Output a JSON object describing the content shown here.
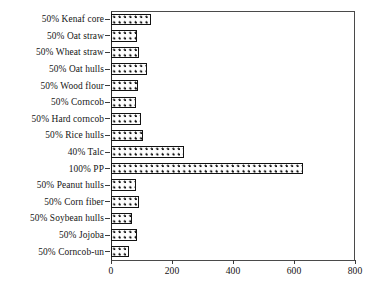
{
  "chart_data": {
    "type": "bar",
    "orientation": "horizontal",
    "title": "",
    "xlabel": "",
    "ylabel": "",
    "xlim": [
      0,
      800
    ],
    "xticks": [
      0,
      200,
      400,
      600,
      800
    ],
    "grid": false,
    "legend": false,
    "categories": [
      "50% Kenaf core",
      "50% Oat straw",
      "50% Wheat straw",
      "50% Oat hulls",
      "50% Wood flour",
      "50% Corncob",
      "50% Hard corncob",
      "50% Rice hulls",
      "40% Talc",
      "100% PP",
      "50% Peanut hulls",
      "50% Corn fiber",
      "50% Soybean hulls",
      "50% Jojoba",
      "50% Corncob-un"
    ],
    "values": [
      132,
      86,
      92,
      119,
      89,
      82,
      99,
      105,
      240,
      629,
      82,
      92,
      69,
      86,
      59
    ],
    "bar_fill": "dotted-pattern",
    "bar_edge_color": "#121212",
    "axis_color": "#3c3c3c",
    "background": "#ffffff"
  },
  "axis": {
    "ticks": [
      {
        "value": 0,
        "label": "0"
      },
      {
        "value": 200,
        "label": "200"
      },
      {
        "value": 400,
        "label": "400"
      },
      {
        "value": 600,
        "label": "600"
      },
      {
        "value": 800,
        "label": "800"
      }
    ]
  }
}
